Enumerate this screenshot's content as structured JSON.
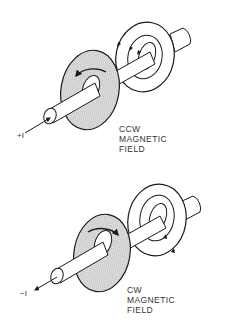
{
  "diagrams": [
    {
      "current_label": "+I",
      "field_label": [
        "CCW",
        "MAGNETIC",
        "FIELD"
      ],
      "direction": "counter-clockwise"
    },
    {
      "current_label": "−I",
      "field_label": [
        "CW",
        "MAGNETIC",
        "FIELD"
      ],
      "direction": "clockwise"
    }
  ],
  "colors": {
    "line": "#1a1a1a",
    "shaded_disk": "#d6d6d6",
    "background": "#ffffff"
  }
}
